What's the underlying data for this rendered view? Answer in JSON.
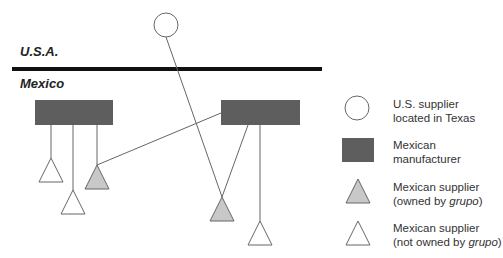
{
  "regions": {
    "usa": "U.S.A.",
    "mexico": "Mexico"
  },
  "colors": {
    "manufacturer": "#5e5e5e",
    "owned_supplier": "#c8c8c8",
    "border": "#111111",
    "line": "#666666"
  },
  "legend": [
    {
      "icon": "circle-icon",
      "line1": "U.S. supplier",
      "line2": "located in Texas"
    },
    {
      "icon": "rectangle-icon",
      "line1": "Mexican",
      "line2": "manufacturer"
    },
    {
      "icon": "gray-triangle-icon",
      "line1": "Mexican supplier",
      "line2_pre": "(owned by ",
      "line2_em": "grupo",
      "line2_post": ")"
    },
    {
      "icon": "white-triangle-icon",
      "line1": "Mexican supplier",
      "line2_pre": "(not owned by ",
      "line2_em": "grupo",
      "line2_post": ")"
    }
  ]
}
